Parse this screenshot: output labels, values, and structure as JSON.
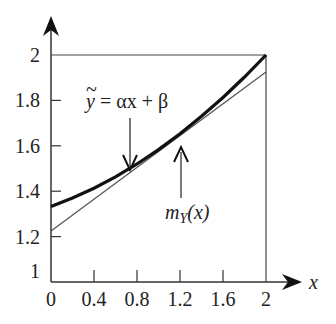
{
  "chart_data": {
    "type": "line",
    "title": "",
    "xlabel": "x",
    "ylabel": "",
    "xlim": [
      0,
      2
    ],
    "ylim": [
      1,
      2
    ],
    "grid": false,
    "x_ticks": [
      "0",
      "0.4",
      "0.8",
      "1.2",
      "1.6",
      "2"
    ],
    "y_ticks": [
      "1",
      "1.2",
      "1.4",
      "1.6",
      "1.8",
      "2"
    ],
    "series": [
      {
        "name": "m_Y(x)",
        "style": "thick curve",
        "x": [
          0,
          0.2,
          0.4,
          0.6,
          0.8,
          1.0,
          1.2,
          1.4,
          1.6,
          1.8,
          2.0
        ],
        "values": [
          1.333,
          1.37,
          1.413,
          1.463,
          1.52,
          1.583,
          1.653,
          1.73,
          1.813,
          1.903,
          2.0
        ]
      },
      {
        "name": "y~ = αx + β",
        "style": "thin line",
        "x": [
          0,
          2
        ],
        "values": [
          1.225,
          1.925
        ]
      }
    ],
    "annotations": [
      {
        "text": "ỹ = αx + β",
        "arrow": "down",
        "points_to": "linear fit",
        "at_x": 0.72
      },
      {
        "text": "m_Y(x)",
        "arrow": "up",
        "points_to": "curve",
        "at_x": 1.2
      }
    ]
  },
  "labels": {
    "x_axis": "x",
    "line_label_y": "y",
    "line_label_rest": " = αx + β",
    "tilde": "~",
    "curve_m": "m",
    "curve_sub": "Y",
    "curve_rest": "(x)"
  }
}
